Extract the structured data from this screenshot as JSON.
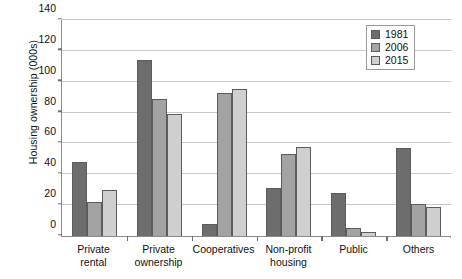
{
  "chart_data": {
    "type": "bar",
    "title": "",
    "subtitle": "",
    "xlabel": "",
    "ylabel": "Housing ownership (000s)",
    "ylim": [
      0,
      140
    ],
    "ytick_step": 20,
    "yticks": [
      0,
      20,
      40,
      60,
      80,
      100,
      120,
      140
    ],
    "grid": true,
    "legend_position": "top-right",
    "categories": [
      "Private\nrental",
      "Private\nownership",
      "Cooperatives",
      "Non-profit\nhousing",
      "Public",
      "Others"
    ],
    "series": [
      {
        "name": "1981",
        "color": "#6d6d6d",
        "values": [
          48,
          114,
          8,
          31,
          28,
          57
        ]
      },
      {
        "name": "2006",
        "color": "#a3a3a3",
        "values": [
          22,
          89,
          93,
          53,
          5,
          21
        ]
      },
      {
        "name": "2015",
        "color": "#cfcfcf",
        "values": [
          30,
          79,
          95,
          58,
          2.5,
          19
        ]
      }
    ]
  }
}
